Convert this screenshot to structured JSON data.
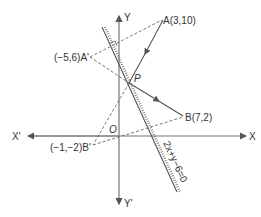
{
  "diagram": {
    "axes": {
      "x_label": "X",
      "x_neg_label": "X'",
      "y_label": "Y",
      "y_neg_label": "Y'",
      "origin_label": "O"
    },
    "points": {
      "A": "A(3,10)",
      "B": "B(7,2)",
      "P": "P",
      "A_image": "(−5,6)A'",
      "B_image": "(−1,−2)B'"
    },
    "mirror_line_equation": "2x+y−6=0",
    "colors": {
      "line": "#555555",
      "text": "#333333"
    }
  }
}
